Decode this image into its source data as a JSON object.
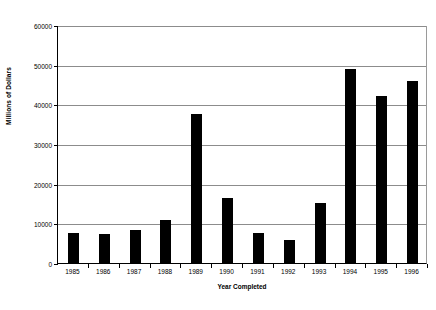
{
  "chart_data": {
    "type": "bar",
    "title": "",
    "xlabel": "Year Completed",
    "ylabel": "Millions of Dollars",
    "categories": [
      "1985",
      "1986",
      "1987",
      "1988",
      "1989",
      "1990",
      "1991",
      "1992",
      "1993",
      "1994",
      "1995",
      "1996"
    ],
    "values": [
      7500,
      7200,
      8200,
      10800,
      37500,
      16500,
      7500,
      5800,
      15200,
      48800,
      42000,
      45800
    ],
    "ylim": [
      0,
      60000
    ],
    "yticks": [
      0,
      10000,
      20000,
      30000,
      40000,
      50000,
      60000
    ],
    "ytick_labels": [
      "0",
      "10000",
      "20000",
      "30000",
      "40000",
      "50000",
      "60000"
    ],
    "grid": true,
    "legend": "none",
    "bar_color": "#000000",
    "gridline_color": "#8c8c8c",
    "background_color": "#ffffff"
  }
}
